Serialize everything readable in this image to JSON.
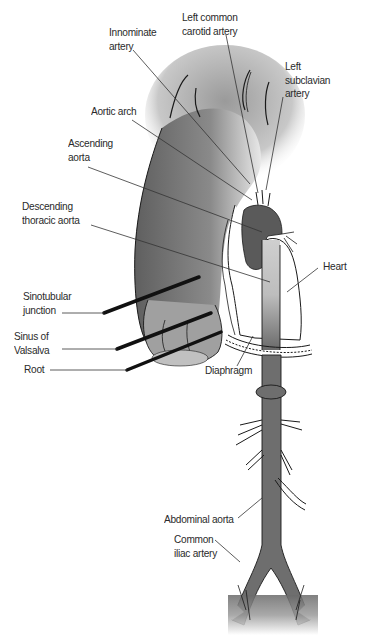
{
  "diagram": {
    "colors": {
      "vessel_fill": "#6e6e6e",
      "vessel_dark": "#555555",
      "outline": "#1a1a1a",
      "heart_fill": "#ffffff",
      "label_text": "#2a2a2a",
      "leader_line": "#333333",
      "background": "#ffffff"
    },
    "labels": {
      "innominate_artery": "Innominate\nartery",
      "left_common_carotid": "Left common\ncarotid artery",
      "left_subclavian": "Left\nsubclavian\nartery",
      "aortic_arch": "Aortic arch",
      "ascending_aorta": "Ascending\naorta",
      "descending_thoracic": "Descending\nthoracic aorta",
      "heart": "Heart",
      "sinotubular_junction": "Sinotubular\njunction",
      "sinus_of_valsalva": "Sinus of\nValsalva",
      "root": "Root",
      "diaphragm": "Diaphragm",
      "abdominal_aorta": "Abdominal aorta",
      "common_iliac": "Common\niliac artery"
    }
  }
}
